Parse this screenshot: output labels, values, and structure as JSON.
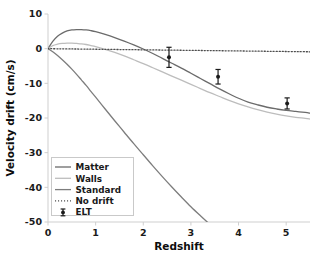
{
  "chart_data": {
    "type": "line",
    "title": "",
    "xlabel": "Redshift",
    "ylabel": "Velocity drift (cm/s)",
    "xlim": [
      0,
      5.5
    ],
    "ylim": [
      -50,
      10
    ],
    "xticks": [
      0,
      1,
      2,
      3,
      4,
      5
    ],
    "xticklabels": [
      "0",
      "1",
      "2",
      "3",
      "4",
      "5"
    ],
    "yticks": [
      10,
      0,
      -10,
      -20,
      -30,
      -40,
      -50
    ],
    "yticklabels": [
      "10",
      "0",
      "-10",
      "-20",
      "-30",
      "-40",
      "-50"
    ],
    "grid": false,
    "legend_position": "lower left",
    "series": [
      {
        "name": "Matter",
        "style": "solid",
        "color": "#6b6b6b",
        "x": [
          0.0,
          0.1,
          0.2,
          0.3,
          0.4,
          0.5,
          0.6,
          0.7,
          0.8,
          0.9,
          1.0,
          1.2,
          1.4,
          1.6,
          1.8,
          2.0,
          2.2,
          2.4,
          2.6,
          2.8,
          3.0,
          3.2,
          3.4,
          3.6,
          3.8,
          4.0,
          4.2,
          4.4,
          4.6,
          4.8,
          5.0,
          5.2,
          5.4,
          5.5
        ],
        "y": [
          0.0,
          2.1,
          3.6,
          4.5,
          5.1,
          5.4,
          5.5,
          5.5,
          5.4,
          5.2,
          4.9,
          4.1,
          3.2,
          2.2,
          1.1,
          -0.1,
          -1.4,
          -2.8,
          -4.2,
          -5.6,
          -7.1,
          -8.6,
          -10.1,
          -11.6,
          -13.0,
          -14.3,
          -15.4,
          -16.2,
          -16.9,
          -17.4,
          -17.8,
          -18.1,
          -18.4,
          -18.6
        ]
      },
      {
        "name": "Walls",
        "style": "solid",
        "color": "#bdbdbd",
        "x": [
          0.0,
          0.1,
          0.2,
          0.3,
          0.4,
          0.5,
          0.6,
          0.7,
          0.8,
          0.9,
          1.0,
          1.2,
          1.4,
          1.6,
          1.8,
          2.0,
          2.2,
          2.4,
          2.6,
          2.8,
          3.0,
          3.2,
          3.4,
          3.6,
          3.8,
          4.0,
          4.2,
          4.4,
          4.6,
          4.8,
          5.0,
          5.2,
          5.4,
          5.5
        ],
        "y": [
          0.0,
          0.9,
          1.3,
          1.5,
          1.6,
          1.6,
          1.5,
          1.4,
          1.2,
          0.9,
          0.6,
          -0.2,
          -1.1,
          -2.1,
          -3.2,
          -4.3,
          -5.5,
          -6.7,
          -7.9,
          -9.1,
          -10.3,
          -11.5,
          -12.7,
          -13.8,
          -14.9,
          -15.9,
          -16.8,
          -17.6,
          -18.3,
          -18.9,
          -19.4,
          -19.8,
          -20.1,
          -20.3
        ]
      },
      {
        "name": "Standard",
        "style": "solid",
        "color": "#7d7d7d",
        "x": [
          0.0,
          0.1,
          0.2,
          0.3,
          0.4,
          0.5,
          0.6,
          0.7,
          0.8,
          0.9,
          1.0,
          1.2,
          1.4,
          1.6,
          1.8,
          2.0,
          2.2,
          2.4,
          2.6,
          2.8,
          3.0,
          3.2,
          3.4,
          3.6,
          3.7
        ],
        "y": [
          0.0,
          -0.9,
          -2.0,
          -3.2,
          -4.5,
          -5.9,
          -7.4,
          -9.0,
          -10.6,
          -12.3,
          -14.0,
          -17.4,
          -20.8,
          -24.1,
          -27.4,
          -30.6,
          -33.8,
          -36.9,
          -39.9,
          -42.8,
          -45.6,
          -48.2,
          -50.7,
          -53.0,
          -54.0
        ]
      },
      {
        "name": "No drift",
        "style": "dotted",
        "color": "#4d4d4d",
        "x": [
          0.0,
          5.5
        ],
        "y": [
          0.0,
          -0.9
        ]
      }
    ],
    "errorbar_series": {
      "name": "ELT",
      "color": "#1a1a1a",
      "points": [
        {
          "x": 2.54,
          "y": -2.5,
          "yerr": 2.9
        },
        {
          "x": 3.57,
          "y": -8.1,
          "yerr": 2.1
        },
        {
          "x": 5.02,
          "y": -15.8,
          "yerr": 1.6
        }
      ]
    },
    "legend": [
      {
        "label": "Matter",
        "style": "solid",
        "color": "#6b6b6b"
      },
      {
        "label": "Walls",
        "style": "solid",
        "color": "#bdbdbd"
      },
      {
        "label": "Standard",
        "style": "solid",
        "color": "#7d7d7d"
      },
      {
        "label": "No drift",
        "style": "dotted",
        "color": "#4d4d4d"
      },
      {
        "label": "ELT",
        "style": "errorbar",
        "color": "#1a1a1a"
      }
    ]
  }
}
